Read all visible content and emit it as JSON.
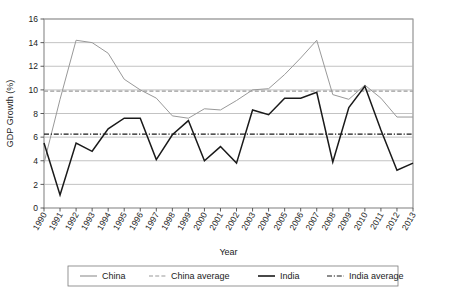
{
  "chart_data": {
    "type": "line",
    "title": "",
    "xlabel": "Year",
    "ylabel": "GDP Growth (%)",
    "xlim": [
      1990,
      2013
    ],
    "ylim": [
      0,
      16
    ],
    "ytick_step": 2,
    "yticks": [
      0,
      2,
      4,
      6,
      8,
      10,
      12,
      14,
      16
    ],
    "grid": "horizontal",
    "legend_position": "bottom",
    "categories": [
      "1990",
      "1991",
      "1992",
      "1993",
      "1994",
      "1995",
      "1996",
      "1997",
      "1998",
      "1999",
      "2000",
      "2001",
      "2002",
      "2003",
      "2004",
      "2005",
      "2006",
      "2007",
      "2008",
      "2009",
      "2010",
      "2011",
      "2012",
      "2013"
    ],
    "series": [
      {
        "name": "China",
        "style": "solid",
        "color": "#999999",
        "values": [
          3.8,
          9.2,
          14.2,
          14.0,
          13.1,
          10.9,
          10.0,
          9.3,
          7.8,
          7.6,
          8.4,
          8.3,
          9.1,
          10.0,
          10.1,
          11.3,
          12.7,
          14.2,
          9.6,
          9.2,
          10.4,
          9.3,
          7.7,
          7.7
        ]
      },
      {
        "name": "China average",
        "style": "dashed",
        "color": "#9a9a9a",
        "constant": 9.9
      },
      {
        "name": "India",
        "style": "solid",
        "color": "#1a1a1a",
        "values": [
          5.5,
          1.1,
          5.5,
          4.8,
          6.7,
          7.6,
          7.6,
          4.1,
          6.2,
          7.4,
          4.0,
          5.2,
          3.8,
          8.3,
          7.9,
          9.3,
          9.3,
          9.8,
          3.9,
          8.5,
          10.3,
          6.6,
          3.2,
          3.8
        ]
      },
      {
        "name": "India average",
        "style": "dashdot",
        "color": "#1a1a1a",
        "constant": 6.25
      }
    ]
  },
  "legend": {
    "items": [
      {
        "label": "China",
        "style": "solid",
        "color": "#999999"
      },
      {
        "label": "China average",
        "style": "dashed",
        "color": "#9a9a9a"
      },
      {
        "label": "India",
        "style": "solid",
        "color": "#1a1a1a"
      },
      {
        "label": "India average",
        "style": "dashdot",
        "color": "#1a1a1a"
      }
    ]
  }
}
